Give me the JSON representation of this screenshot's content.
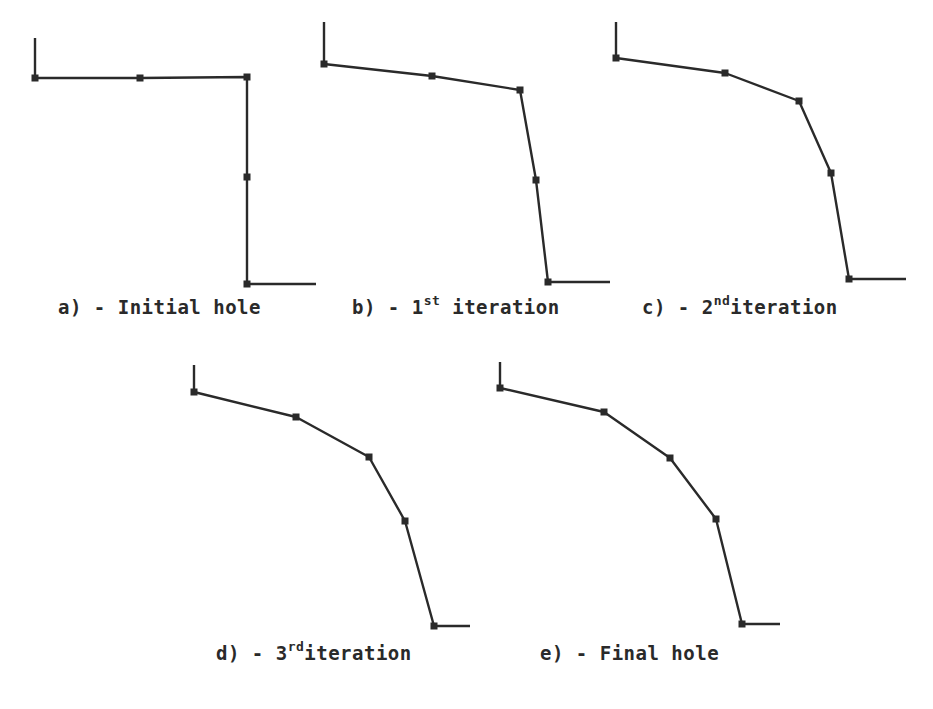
{
  "figure": {
    "line_color": "#2a2a2a",
    "panels": [
      {
        "id": "a",
        "caption": {
          "prefix": "a) - Initial hole",
          "sup": "",
          "suffix": ""
        },
        "caption_pos": {
          "x": 58,
          "y": 296
        },
        "tick": [
          [
            35,
            38
          ],
          [
            35,
            78
          ]
        ],
        "nodes": [
          [
            35,
            78
          ],
          [
            140,
            78
          ],
          [
            247,
            77
          ],
          [
            247,
            177
          ],
          [
            247,
            284
          ]
        ],
        "tail": [
          [
            247,
            284
          ],
          [
            316,
            284
          ]
        ]
      },
      {
        "id": "b",
        "caption": {
          "prefix": "b) - 1",
          "sup": "st",
          "suffix": " iteration"
        },
        "caption_pos": {
          "x": 352,
          "y": 296
        },
        "tick": [
          [
            324,
            22
          ],
          [
            324,
            64
          ]
        ],
        "nodes": [
          [
            324,
            64
          ],
          [
            432,
            76
          ],
          [
            520,
            90
          ],
          [
            536,
            180
          ],
          [
            548,
            282
          ]
        ],
        "tail": [
          [
            548,
            282
          ],
          [
            610,
            282
          ]
        ]
      },
      {
        "id": "c",
        "caption": {
          "prefix": "c) - 2",
          "sup": "nd",
          "suffix": "iteration"
        },
        "caption_pos": {
          "x": 642,
          "y": 296
        },
        "tick": [
          [
            616,
            22
          ],
          [
            616,
            58
          ]
        ],
        "nodes": [
          [
            616,
            58
          ],
          [
            725,
            73
          ],
          [
            799,
            101
          ],
          [
            831,
            173
          ],
          [
            849,
            279
          ]
        ],
        "tail": [
          [
            849,
            279
          ],
          [
            906,
            279
          ]
        ]
      },
      {
        "id": "d",
        "caption": {
          "prefix": "d) - 3",
          "sup": "rd",
          "suffix": "iteration"
        },
        "caption_pos": {
          "x": 216,
          "y": 642
        },
        "tick": [
          [
            194,
            365
          ],
          [
            194,
            392
          ]
        ],
        "nodes": [
          [
            194,
            392
          ],
          [
            296,
            417
          ],
          [
            369,
            457
          ],
          [
            405,
            521
          ],
          [
            434,
            626
          ]
        ],
        "tail": [
          [
            434,
            626
          ],
          [
            470,
            626
          ]
        ]
      },
      {
        "id": "e",
        "caption": {
          "prefix": "e) - Final hole",
          "sup": "",
          "suffix": ""
        },
        "caption_pos": {
          "x": 540,
          "y": 642
        },
        "tick": [
          [
            500,
            362
          ],
          [
            500,
            388
          ]
        ],
        "nodes": [
          [
            500,
            388
          ],
          [
            604,
            412
          ],
          [
            670,
            458
          ],
          [
            716,
            519
          ],
          [
            742,
            624
          ]
        ],
        "tail": [
          [
            742,
            624
          ],
          [
            780,
            624
          ]
        ]
      }
    ]
  }
}
